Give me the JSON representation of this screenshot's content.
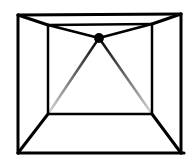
{
  "diagram": {
    "stroke_color": "#000000",
    "background": "#ffffff",
    "outer_square": {
      "x1": 18,
      "y1": 15,
      "x2": 181,
      "y2": 153
    },
    "inner_rect": {
      "x1": 48,
      "y1": 25,
      "x2": 152,
      "y2": 114
    },
    "apex": {
      "cx": 99,
      "cy": 38,
      "r": 5
    },
    "labels": []
  }
}
